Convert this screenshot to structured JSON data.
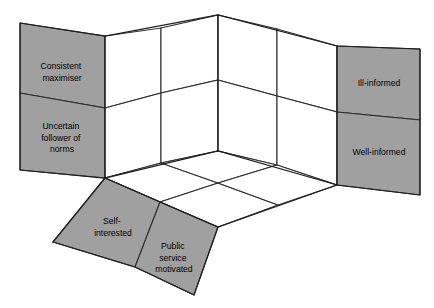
{
  "figure": {
    "type": "3d-cube-framework-diagram",
    "background_color": "#ffffff",
    "panel_fill_grey": "#a0a0a0",
    "panel_fill_white": "#ffffff",
    "edge_color": "#1f1f1f"
  },
  "left_wall": {
    "axis_name": "behavioural assumption",
    "cells": [
      {
        "id": "left-top",
        "lines": [
          "Consistent",
          "maximiser"
        ]
      },
      {
        "id": "left-bottom",
        "lines": [
          "Uncertain",
          "follower of",
          "norms"
        ]
      }
    ]
  },
  "right_wall": {
    "axis_name": "information",
    "cells": [
      {
        "id": "right-top",
        "lines": [
          "Ill-informed"
        ]
      },
      {
        "id": "right-bottom",
        "lines": [
          "Well-informed"
        ]
      }
    ]
  },
  "floor": {
    "axis_name": "motivation",
    "cells": [
      {
        "id": "floor-left",
        "lines": [
          "Self-",
          "interested"
        ]
      },
      {
        "id": "floor-right",
        "lines": [
          "Public",
          "service",
          "motivated"
        ]
      }
    ]
  }
}
